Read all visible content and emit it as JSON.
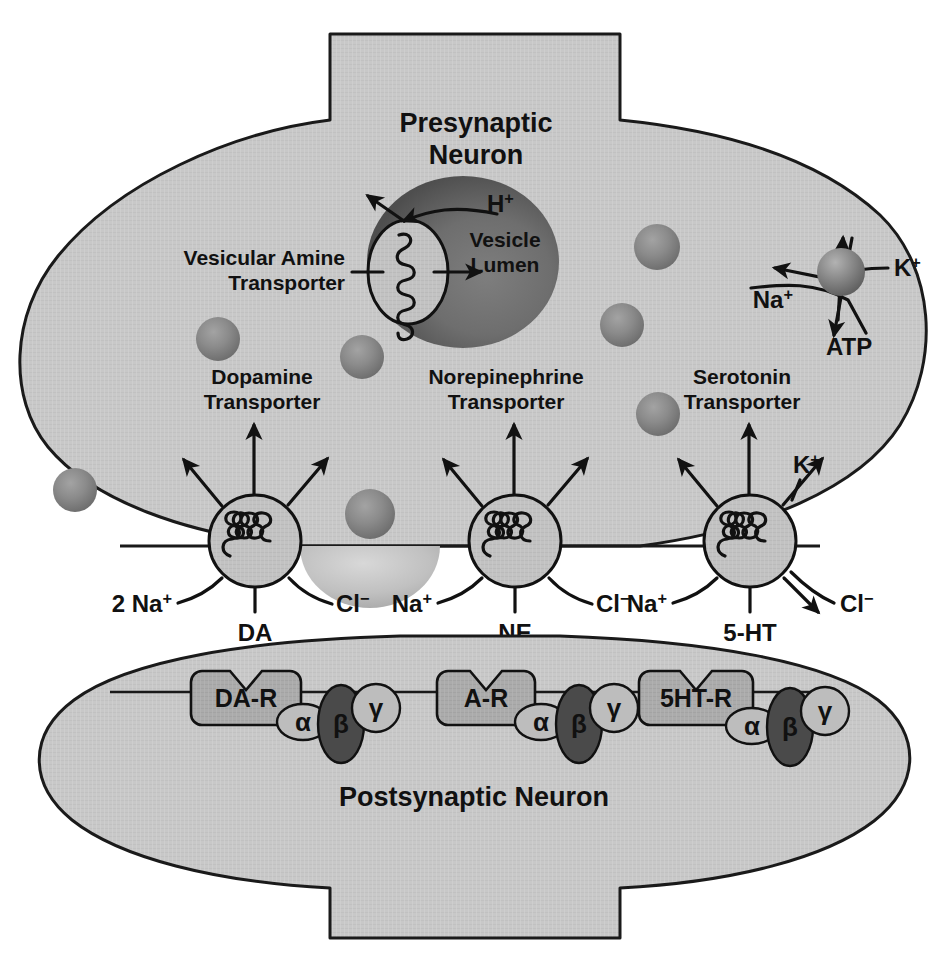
{
  "diagram": {
    "presynaptic_label": {
      "line1": "Presynaptic",
      "line2": "Neuron"
    },
    "postsynaptic_label": "Postsynaptic Neuron",
    "vesicle": {
      "lumen_line1": "Vesicle",
      "lumen_line2": "Lumen",
      "proton_label": "H+",
      "transporter_label_line1": "Vesicular Amine",
      "transporter_label_line2": "Transporter"
    },
    "pump": {
      "sodium_label": "Na+",
      "potassium_label": "K+",
      "energy_label": "ATP"
    },
    "transporters": [
      {
        "id": "dopamine",
        "name_line1": "Dopamine",
        "name_line2": "Transporter",
        "substrate": "DA",
        "cotransport_left": "2 Na+",
        "cotransport_right": "Cl-"
      },
      {
        "id": "norepinephrine",
        "name_line1": "Norepinephrine",
        "name_line2": "Transporter",
        "substrate": "NE",
        "cotransport_left": "Na+",
        "cotransport_right": "Cl-"
      },
      {
        "id": "serotonin",
        "name_line1": "Serotonin",
        "name_line2": "Transporter",
        "substrate": "5-HT",
        "cotransport_left": "Na+",
        "efflux_up": "K+",
        "efflux_down": "Cl-"
      }
    ],
    "receptors": [
      {
        "id": "dopamine-receptor",
        "label": "DA-R",
        "subunits": [
          "α",
          "β",
          "γ"
        ]
      },
      {
        "id": "adrenergic-receptor",
        "label": "A-R",
        "subunits": [
          "α",
          "β",
          "γ"
        ]
      },
      {
        "id": "serotonin-receptor",
        "label": "5HT-R",
        "subunits": [
          "α",
          "β",
          "γ"
        ]
      }
    ],
    "colors": {
      "cytoplasm": "#c8c8c8",
      "cytoplasm_edge": "#1a1a1a",
      "vesicle_dark": "#6d6d6d",
      "vesicle_small": "#8c8c8c",
      "transporter_body": "#c0c0c0",
      "receptor_body": "#a8a8a8",
      "subunit_light": "#bdbdbd",
      "subunit_dark": "#4a4a4a",
      "ink": "#111111",
      "background": "#ffffff"
    }
  }
}
